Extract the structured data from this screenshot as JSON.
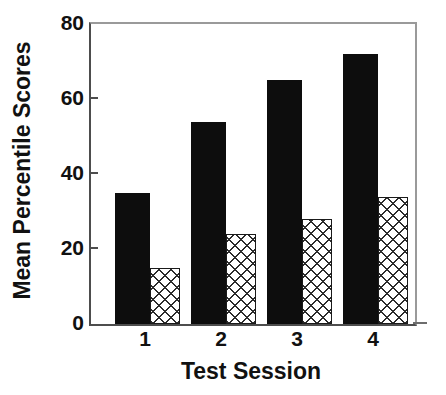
{
  "chart_data": {
    "type": "bar",
    "title": "",
    "xlabel": "Test Session",
    "ylabel": "Mean Percentile Scores",
    "categories": [
      "1",
      "2",
      "3",
      "4"
    ],
    "ylim": [
      0,
      80
    ],
    "yticks": [
      0,
      20,
      40,
      60,
      80
    ],
    "ytick_labels": [
      "0",
      "20",
      "40",
      "60",
      "80"
    ],
    "grid": false,
    "legend": "none",
    "series": [
      {
        "name": "solid-black-series",
        "fill": "solid-black",
        "color": "#0d0d0d",
        "values": [
          35,
          54,
          65,
          72
        ]
      },
      {
        "name": "crosshatch-series",
        "fill": "cross-hatch",
        "color": "#ffffff",
        "values": [
          15,
          24,
          28,
          34
        ]
      }
    ]
  },
  "axes": {
    "y_title": "Mean Percentile Scores",
    "x_title": "Test Session",
    "y_tick_0": "0",
    "y_tick_1": "20",
    "y_tick_2": "40",
    "y_tick_3": "60",
    "y_tick_4": "80",
    "x_tick_0": "1",
    "x_tick_1": "2",
    "x_tick_2": "3",
    "x_tick_3": "4"
  },
  "colors": {
    "series_a": "#0d0d0d",
    "series_b": "#ffffff",
    "hatch_line": "#2b2b2b",
    "axis": "#4d4d4d",
    "background": "#ffffff",
    "text": "#111111"
  }
}
